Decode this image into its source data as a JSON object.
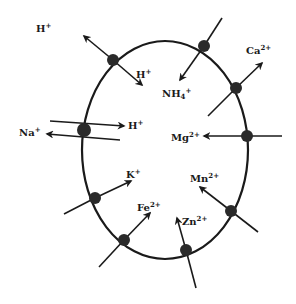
{
  "diagram": {
    "colors": {
      "line": "#1a1a1a",
      "node": "#2a2a2a",
      "background": "#ffffff"
    },
    "membrane": {
      "cx": 165,
      "cy": 150,
      "rx": 83,
      "ry": 109
    },
    "ions": [
      {
        "id": "h-plus-out",
        "base": "H",
        "charge": "+",
        "sub": "",
        "x": 36,
        "y": 22
      },
      {
        "id": "h-plus-in-top",
        "base": "H",
        "charge": "+",
        "sub": "",
        "x": 136,
        "y": 69
      },
      {
        "id": "nh4-plus",
        "base": "NH",
        "sub": "4",
        "charge": "+",
        "x": 162,
        "y": 87
      },
      {
        "id": "ca-2plus",
        "base": "Ca",
        "charge": "2+",
        "sub": "",
        "x": 246,
        "y": 44
      },
      {
        "id": "na-plus",
        "base": "Na",
        "charge": "+",
        "sub": "",
        "x": 19,
        "y": 126
      },
      {
        "id": "h-plus-in-mid",
        "base": "H",
        "charge": "+",
        "sub": "",
        "x": 128,
        "y": 121
      },
      {
        "id": "mg-2plus",
        "base": "Mg",
        "charge": "2+",
        "sub": "",
        "x": 171,
        "y": 132
      },
      {
        "id": "k-plus",
        "base": "K",
        "charge": "+",
        "sub": "",
        "x": 126,
        "y": 168
      },
      {
        "id": "mn-2plus",
        "base": "Mn",
        "charge": "2+",
        "sub": "",
        "x": 190,
        "y": 172
      },
      {
        "id": "fe-2plus",
        "base": "Fe",
        "charge": "2+",
        "sub": "",
        "x": 137,
        "y": 201
      },
      {
        "id": "zn-2plus",
        "base": "Zn",
        "charge": "2+",
        "sub": "",
        "x": 182,
        "y": 215
      }
    ]
  }
}
